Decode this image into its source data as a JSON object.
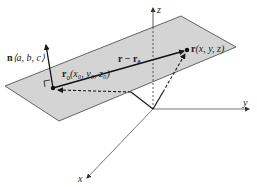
{
  "diagram": {
    "colors": {
      "plane_fill": "#d4d4d4",
      "plane_edge": "#555555",
      "line": "#1a1a1a",
      "axis": "#444444"
    },
    "axes": {
      "x_label": "x",
      "y_label": "y",
      "z_label": "z"
    },
    "normal": {
      "bold": "n",
      "components": "⟨a, b, c⟩"
    },
    "point_r0": {
      "bold": "r",
      "sub": "0",
      "coords": "(x₀, y₀, z₀)"
    },
    "point_r": {
      "bold": "r",
      "coords": "(x, y, z)"
    },
    "vector_diff": {
      "label": "r − r₀"
    }
  }
}
